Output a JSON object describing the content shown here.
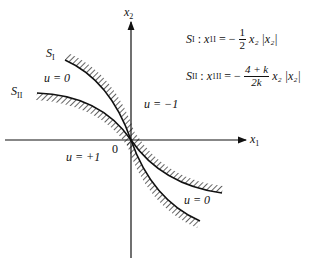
{
  "axes": {
    "x_label": "x",
    "x_sub": "1",
    "y_label": "x",
    "y_sub": "2",
    "origin_label": "0"
  },
  "curves": {
    "s1": {
      "label_main": "S",
      "label_sub": "I"
    },
    "s2": {
      "label_main": "S",
      "label_sub": "II"
    }
  },
  "regions": {
    "u_zero_upper": "u = 0",
    "u_minus_one": "u = −1",
    "u_plus_one": "u = +1",
    "u_zero_lower": "u = 0"
  },
  "formulas": {
    "f1": {
      "lhs_main": "S",
      "lhs_sub": "I",
      "sep": " : ",
      "var_main": "x",
      "var_sub": "1I",
      "eq": " = −",
      "numerator": "1",
      "denominator": "2",
      "rhs": "x₂ |x₂|"
    },
    "f2": {
      "lhs_main": "S",
      "lhs_sub": "II",
      "sep": " : ",
      "var_main": "x",
      "var_sub": "1II",
      "eq": " = −",
      "numerator": "4 + k",
      "denominator": "2k",
      "rhs": "x₂ |x₂|"
    }
  }
}
